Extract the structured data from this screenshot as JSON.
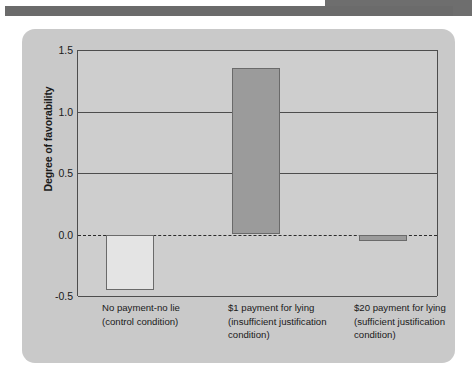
{
  "figure": {
    "y_axis_title": "Degree of favorability"
  },
  "chart_data": {
    "type": "bar",
    "title": "",
    "xlabel": "",
    "ylabel": "Degree of favorability",
    "ylim": [
      -0.5,
      1.5
    ],
    "yticks": [
      "1.5",
      "1.0",
      "0.5",
      "0.0",
      "-0.5"
    ],
    "ytick_values": [
      1.5,
      1.0,
      0.5,
      0.0,
      -0.5
    ],
    "grid": true,
    "legend": "none",
    "zero_reference_line": true,
    "categories": [
      "No payment-no lie (control condition)",
      "$1 payment for lying (insufficient justification condition)",
      "$20 payment for lying (sufficient justification condition)"
    ],
    "category_lines": [
      [
        "No payment-no lie",
        "(control condition)"
      ],
      [
        "$1 payment for lying",
        "(insufficient justification",
        "condition)"
      ],
      [
        "$20 payment for lying",
        "(sufficient justification",
        "condition)"
      ]
    ],
    "values": [
      -0.45,
      1.35,
      -0.05
    ],
    "bar_colors": [
      "#e4e4e4",
      "#9b9b9b",
      "#9b9b9b"
    ]
  },
  "colors": {
    "panel_background": "#c9c9c9",
    "plot_background": "#cecece",
    "axis": "#4d4d4d",
    "header_band": "#6b6b6b",
    "text": "#1a1a1a"
  }
}
